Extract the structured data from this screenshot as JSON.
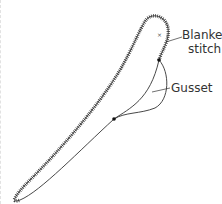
{
  "diagram": {
    "labels": {
      "blanket_stitch_line1": "Blanket",
      "blanket_stitch_line2": "stitch",
      "gusset": "Gusset"
    },
    "colors": {
      "line": "#333333",
      "background": "#ffffff"
    }
  }
}
